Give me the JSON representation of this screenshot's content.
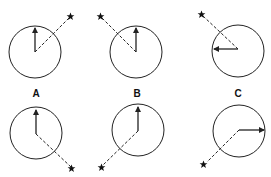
{
  "labels": {
    "a": "A",
    "b": "B",
    "c": "C"
  },
  "colors": {
    "stroke": "#222222",
    "background": "#ffffff"
  },
  "panels": [
    {
      "id": "top-a",
      "row": "top",
      "column": "A",
      "center": [
        35,
        52
      ],
      "radius": 26,
      "arrow_direction": "up",
      "star_position": "upper-right"
    },
    {
      "id": "top-b",
      "row": "top",
      "column": "B",
      "center": [
        136,
        52
      ],
      "radius": 26,
      "arrow_direction": "up",
      "star_position": "upper-left"
    },
    {
      "id": "top-c",
      "row": "top",
      "column": "C",
      "center": [
        238,
        51
      ],
      "radius": 26,
      "arrow_direction": "left",
      "star_position": "upper-left"
    },
    {
      "id": "bottom-a",
      "row": "bottom",
      "column": "A",
      "center": [
        36,
        133
      ],
      "radius": 26,
      "arrow_direction": "up",
      "star_position": "lower-right"
    },
    {
      "id": "bottom-b",
      "row": "bottom",
      "column": "B",
      "center": [
        138,
        130
      ],
      "radius": 26,
      "arrow_direction": "up",
      "star_position": "lower-left"
    },
    {
      "id": "bottom-c",
      "row": "bottom",
      "column": "C",
      "center": [
        239,
        131
      ],
      "radius": 26,
      "arrow_direction": "right",
      "star_position": "lower-left"
    }
  ]
}
